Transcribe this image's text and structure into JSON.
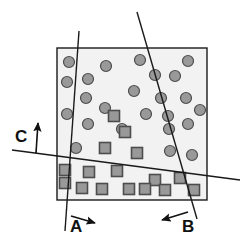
{
  "figure": {
    "background_color": "#ffffff",
    "width": 248,
    "height": 248
  },
  "plot_region": {
    "name": "feature-space-box",
    "x": 57,
    "y": 48,
    "width": 150,
    "height": 152,
    "fill_color": "#f2f2f2",
    "stroke_color": "#1a1a1a",
    "stroke_width": 1.4
  },
  "style": {
    "marker_fill": "#999999",
    "marker_stroke": "#4d4d4d",
    "line_color": "#1a1a1a",
    "line_width": 1.4,
    "arrow_color": "#111111",
    "label_color": "#111111"
  },
  "labels": [
    {
      "id": "A",
      "text": "A",
      "x": 70,
      "y": 232
    },
    {
      "id": "B",
      "text": "B",
      "x": 182,
      "y": 232
    },
    {
      "id": "C",
      "text": "C",
      "x": 15,
      "y": 142
    }
  ],
  "boundaries": [
    {
      "id": "A",
      "name": "boundary-line-a",
      "x1": 79,
      "y1": 31,
      "x2": 65,
      "y2": 231,
      "label": "A",
      "normal_arrow": {
        "x1": 71,
        "y1": 216,
        "x2": 95,
        "y2": 223
      }
    },
    {
      "id": "B",
      "name": "boundary-line-b",
      "x1": 137,
      "y1": 12,
      "x2": 197,
      "y2": 219,
      "label": "B",
      "normal_arrow": {
        "x1": 188,
        "y1": 212,
        "x2": 162,
        "y2": 220
      }
    },
    {
      "id": "C",
      "name": "boundary-line-c",
      "x1": 12,
      "y1": 150,
      "x2": 240,
      "y2": 180,
      "label": "C",
      "normal_arrow": {
        "x1": 36,
        "y1": 153,
        "x2": 38,
        "y2": 123
      }
    }
  ],
  "chart_data": {
    "type": "scatter",
    "xlabel": "",
    "ylabel": "",
    "xlim": [
      57,
      207
    ],
    "ylim": [
      48,
      200
    ],
    "grid": false,
    "legend": null,
    "annotations": [
      "A",
      "B",
      "C"
    ],
    "series": [
      {
        "name": "class-circle",
        "marker": "circle",
        "marker_size": 11,
        "fill": "#999999",
        "stroke": "#4d4d4d",
        "count": 24,
        "points": [
          [
            69,
            62
          ],
          [
            106,
            66
          ],
          [
            140,
            60
          ],
          [
            188,
            61
          ],
          [
            67,
            82
          ],
          [
            88,
            79
          ],
          [
            155,
            75
          ],
          [
            175,
            76
          ],
          [
            86,
            98
          ],
          [
            134,
            91
          ],
          [
            161,
            98
          ],
          [
            186,
            98
          ],
          [
            67,
            114
          ],
          [
            146,
            114
          ],
          [
            168,
            116
          ],
          [
            88,
            124
          ],
          [
            122,
            129
          ],
          [
            169,
            129
          ],
          [
            188,
            124
          ],
          [
            76,
            148
          ],
          [
            170,
            151
          ],
          [
            192,
            155
          ],
          [
            200,
            110
          ],
          [
            105,
            108
          ]
        ]
      },
      {
        "name": "class-square",
        "marker": "square",
        "marker_size": 11,
        "fill": "#999999",
        "stroke": "#4d4d4d",
        "count": 16,
        "points": [
          [
            114,
            116
          ],
          [
            125,
            132
          ],
          [
            105,
            148
          ],
          [
            137,
            153
          ],
          [
            65,
            170
          ],
          [
            65,
            183
          ],
          [
            89,
            172
          ],
          [
            117,
            171
          ],
          [
            155,
            180
          ],
          [
            102,
            189
          ],
          [
            129,
            189
          ],
          [
            165,
            190
          ],
          [
            180,
            178
          ],
          [
            194,
            190
          ],
          [
            82,
            188
          ],
          [
            145,
            189
          ]
        ]
      }
    ]
  }
}
